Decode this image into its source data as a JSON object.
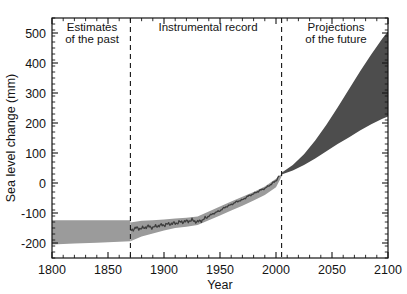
{
  "chart_data": {
    "type": "area",
    "title": "",
    "xlabel": "Year",
    "ylabel": "Sea level change (mm)",
    "xlim": [
      1800,
      2100
    ],
    "ylim": [
      -250,
      550
    ],
    "grid": false,
    "legend_position": "none",
    "x_ticks": [
      1800,
      1850,
      1900,
      1950,
      2000,
      2050,
      2100
    ],
    "x_tick_labels": [
      "1800",
      "1850",
      "1900",
      "1950",
      "2000",
      "2050",
      "2100"
    ],
    "x_minor_tick_interval": 10,
    "y_ticks": [
      -200,
      -100,
      0,
      100,
      200,
      300,
      400,
      500
    ],
    "y_tick_labels": [
      "-200",
      "-100",
      "0",
      "100",
      "200",
      "300",
      "400",
      "500"
    ],
    "y_minor_tick_interval": 20,
    "annotations": [
      {
        "text_line1": "Estimates",
        "text_line2": "of the past",
        "x": 1835,
        "y": 500
      },
      {
        "text_line1": "Instrumental record",
        "text_line2": "",
        "x": 1937,
        "y": 505
      },
      {
        "text_line1": "Projections",
        "text_line2": "of the future",
        "x": 2052,
        "y": 500
      }
    ],
    "dividers": [
      {
        "x": 1870,
        "style": "dashed"
      },
      {
        "x": 2005,
        "style": "dashed"
      }
    ],
    "series": [
      {
        "name": "Estimates of the past (uncertainty band)",
        "type": "band",
        "color": "#9b9b9b",
        "x": [
          1800,
          1820,
          1840,
          1860,
          1870
        ],
        "upper": [
          -124,
          -124,
          -124,
          -124,
          -124
        ],
        "lower": [
          -205,
          -202,
          -199,
          -196,
          -194
        ]
      },
      {
        "name": "Instrumental record (uncertainty band)",
        "type": "band",
        "color": "#9b9b9b",
        "x": [
          1870,
          1880,
          1890,
          1900,
          1910,
          1920,
          1930,
          1940,
          1950,
          1960,
          1970,
          1980,
          1990,
          2000,
          2005
        ],
        "upper": [
          -132,
          -126,
          -124,
          -122,
          -118,
          -116,
          -112,
          -95,
          -78,
          -62,
          -46,
          -30,
          -12,
          14,
          30
        ],
        "lower": [
          -194,
          -178,
          -168,
          -158,
          -150,
          -146,
          -140,
          -124,
          -108,
          -92,
          -76,
          -58,
          -40,
          -14,
          22
        ]
      },
      {
        "name": "Instrumental record (central estimate)",
        "type": "line",
        "color": "#3d3d3d",
        "x": [
          1870,
          1875,
          1880,
          1885,
          1890,
          1895,
          1900,
          1905,
          1910,
          1915,
          1920,
          1925,
          1930,
          1935,
          1940,
          1945,
          1950,
          1955,
          1960,
          1965,
          1970,
          1975,
          1980,
          1985,
          1990,
          1995,
          2000,
          2003
        ],
        "y": [
          -158,
          -150,
          -152,
          -145,
          -148,
          -142,
          -140,
          -136,
          -134,
          -130,
          -128,
          -124,
          -130,
          -122,
          -110,
          -100,
          -92,
          -80,
          -72,
          -62,
          -56,
          -44,
          -36,
          -26,
          -18,
          -6,
          8,
          24
        ]
      },
      {
        "name": "Projections of the future (range)",
        "type": "band",
        "color": "#4d4d4d",
        "x": [
          2005,
          2015,
          2025,
          2035,
          2045,
          2055,
          2065,
          2075,
          2085,
          2095,
          2100
        ],
        "upper": [
          34,
          60,
          96,
          142,
          194,
          252,
          312,
          372,
          428,
          482,
          505
        ],
        "lower": [
          28,
          42,
          60,
          82,
          106,
          130,
          152,
          175,
          196,
          214,
          222
        ]
      }
    ]
  },
  "axes": {
    "y_axis_title": "Sea level change (mm)",
    "x_axis_title": "Year"
  },
  "labels": {
    "estimates_line1": "Estimates",
    "estimates_line2": "of the past",
    "instrumental": "Instrumental record",
    "projections_line1": "Projections",
    "projections_line2": "of the future"
  },
  "colors": {
    "background": "#ffffff",
    "axis": "#141414",
    "historical_band": "#9b9b9b",
    "instrumental_band": "#9b9b9b",
    "instrumental_line": "#3d3d3d",
    "projection_band": "#4d4d4d"
  }
}
